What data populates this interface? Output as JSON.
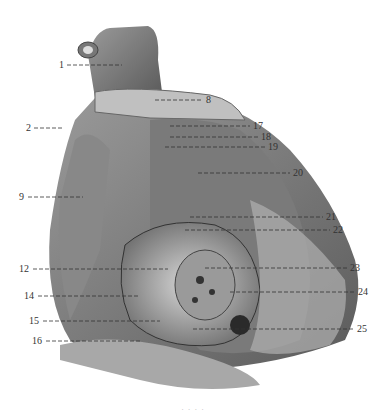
{
  "figure": {
    "type": "anatomical-illustration",
    "palette": {
      "background": "#ffffff",
      "ink": "#333333",
      "tissue_dark": "#4a4a4a",
      "tissue_mid": "#8a8a8a",
      "tissue_light": "#c8c8c8"
    },
    "labels": [
      {
        "id": "1",
        "text": "1",
        "side": "left",
        "x": 59,
        "y": 65,
        "line_to": 122
      },
      {
        "id": "2",
        "text": "2",
        "side": "left",
        "x": 26,
        "y": 128,
        "line_to": 62
      },
      {
        "id": "8",
        "text": "8",
        "side": "right",
        "x": 206,
        "y": 100,
        "line_from": 155
      },
      {
        "id": "9",
        "text": "9",
        "side": "left",
        "x": 19,
        "y": 197,
        "line_to": 83
      },
      {
        "id": "12",
        "text": "12",
        "side": "left",
        "x": 19,
        "y": 269,
        "line_to": 168
      },
      {
        "id": "14",
        "text": "14",
        "side": "left",
        "x": 24,
        "y": 296,
        "line_to": 140
      },
      {
        "id": "15",
        "text": "15",
        "side": "left",
        "x": 29,
        "y": 321,
        "line_to": 160
      },
      {
        "id": "16",
        "text": "16",
        "side": "left",
        "x": 32,
        "y": 341,
        "line_to": 140
      },
      {
        "id": "17",
        "text": "17",
        "side": "right",
        "x": 253,
        "y": 126,
        "line_from": 170
      },
      {
        "id": "18",
        "text": "18",
        "side": "right",
        "x": 261,
        "y": 137,
        "line_from": 170
      },
      {
        "id": "19",
        "text": "19",
        "side": "right",
        "x": 268,
        "y": 147,
        "line_from": 165
      },
      {
        "id": "20",
        "text": "20",
        "side": "right",
        "x": 293,
        "y": 173,
        "line_from": 198
      },
      {
        "id": "21",
        "text": "21",
        "side": "right",
        "x": 326,
        "y": 217,
        "line_from": 190
      },
      {
        "id": "22",
        "text": "22",
        "side": "right",
        "x": 333,
        "y": 230,
        "line_from": 185
      },
      {
        "id": "23",
        "text": "23",
        "side": "right",
        "x": 350,
        "y": 268,
        "line_from": 205
      },
      {
        "id": "24",
        "text": "24",
        "side": "right",
        "x": 358,
        "y": 292,
        "line_from": 230
      },
      {
        "id": "25",
        "text": "25",
        "side": "right",
        "x": 357,
        "y": 329,
        "line_from": 193
      }
    ],
    "caption": "· · · ·"
  }
}
